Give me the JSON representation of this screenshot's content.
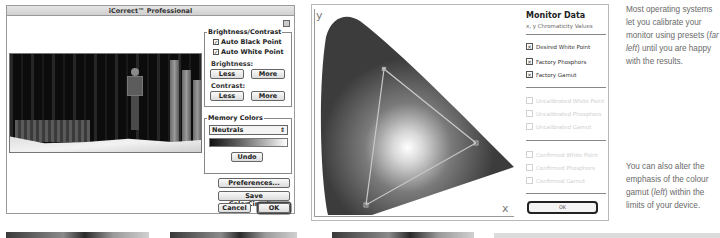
{
  "icorrect": {
    "title": "iCorrect™ Professional",
    "brightness_contrast": {
      "group_title": "Brightness/Contrast",
      "auto_black_point": {
        "label": "Auto Black Point",
        "checked": true
      },
      "auto_white_point": {
        "label": "Auto White Point",
        "checked": true
      },
      "brightness_label": "Brightness:",
      "contrast_label": "Contrast:",
      "less_label": "Less",
      "more_label": "More"
    },
    "memory_colors": {
      "group_title": "Memory Colors",
      "selected": "Neutrals",
      "select_arrow": "⇕",
      "undo_label": "Undo"
    },
    "preferences_label": "Preferences...",
    "save_label": "Save ColorCircuit...",
    "cancel_label": "Cancel",
    "ok_label": "OK",
    "check_glyph": "✓"
  },
  "monitor": {
    "title": "Monitor Data",
    "subtitle": "x, y Chromaticity Values",
    "axis_y": "y",
    "axis_x": "x",
    "groups": [
      {
        "items": [
          {
            "label": "Desired White Point",
            "checked": true,
            "enabled": true
          },
          {
            "label": "Factory Phosphors",
            "checked": true,
            "enabled": true
          },
          {
            "label": "Factory Gamut",
            "checked": true,
            "enabled": true
          }
        ]
      },
      {
        "items": [
          {
            "label": "Uncalibrated White Point",
            "checked": false,
            "enabled": false
          },
          {
            "label": "Uncalibrated Phosphors",
            "checked": false,
            "enabled": false
          },
          {
            "label": "Uncalibrated Gamut",
            "checked": false,
            "enabled": false
          }
        ]
      },
      {
        "items": [
          {
            "label": "Confirmed White Point",
            "checked": false,
            "enabled": false
          },
          {
            "label": "Confirmed Phosphors",
            "checked": false,
            "enabled": false
          },
          {
            "label": "Confirmed Gamut",
            "checked": false,
            "enabled": false
          }
        ]
      }
    ],
    "check_glyph": "×",
    "ok_label": "OK"
  },
  "captions": {
    "top": {
      "before": "Most operating systems let you calibrate your monitor using presets (",
      "em": "far left",
      "after": ") until you are happy with the results."
    },
    "bottom": {
      "before": "You can also alter the emphasis of the colour gamut (",
      "em": "left",
      "after": ") within the limits of your device."
    }
  }
}
